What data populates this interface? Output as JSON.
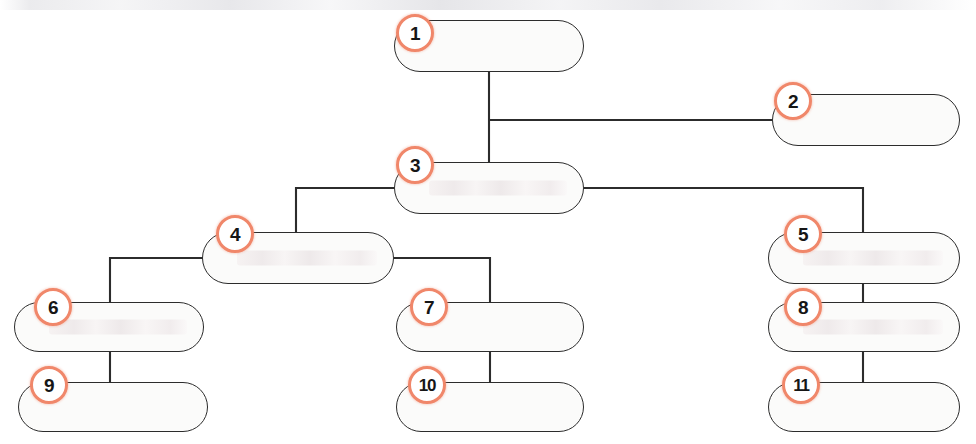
{
  "diagram": {
    "type": "tree",
    "canvas": {
      "width": 976,
      "height": 444
    },
    "style": {
      "badge_ring_color": "#f0876a",
      "badge_fill_color": "#ffffff",
      "badge_text_color": "#161616",
      "node_fill_color": "#fbfbfa",
      "node_border_color": "#2c2c2c",
      "connector_color": "#2c2c2c",
      "background_color": "#ffffff"
    },
    "nodes": [
      {
        "id": "node-1",
        "number": "1",
        "label": "",
        "x": 394,
        "y": 20,
        "w": 190,
        "h": 52,
        "badge_x": 396,
        "badge_y": 14,
        "ghost": false
      },
      {
        "id": "node-2",
        "number": "2",
        "label": "",
        "x": 772,
        "y": 94,
        "w": 188,
        "h": 52,
        "badge_x": 774,
        "badge_y": 82,
        "ghost": false
      },
      {
        "id": "node-3",
        "number": "3",
        "label": "",
        "x": 394,
        "y": 162,
        "w": 190,
        "h": 52,
        "badge_x": 396,
        "badge_y": 146,
        "ghost": true
      },
      {
        "id": "node-4",
        "number": "4",
        "label": "",
        "x": 202,
        "y": 232,
        "w": 192,
        "h": 52,
        "badge_x": 216,
        "badge_y": 215,
        "ghost": true
      },
      {
        "id": "node-5",
        "number": "5",
        "label": "",
        "x": 768,
        "y": 232,
        "w": 192,
        "h": 52,
        "badge_x": 784,
        "badge_y": 215,
        "ghost": true
      },
      {
        "id": "node-6",
        "number": "6",
        "label": "",
        "x": 14,
        "y": 302,
        "w": 190,
        "h": 50,
        "badge_x": 34,
        "badge_y": 288,
        "ghost": true
      },
      {
        "id": "node-7",
        "number": "7",
        "label": "",
        "x": 396,
        "y": 302,
        "w": 188,
        "h": 50,
        "badge_x": 410,
        "badge_y": 288,
        "ghost": false
      },
      {
        "id": "node-8",
        "number": "8",
        "label": "",
        "x": 768,
        "y": 302,
        "w": 192,
        "h": 50,
        "badge_x": 784,
        "badge_y": 288,
        "ghost": true
      },
      {
        "id": "node-9",
        "number": "9",
        "label": "",
        "x": 18,
        "y": 382,
        "w": 190,
        "h": 50,
        "badge_x": 30,
        "badge_y": 366,
        "ghost": false
      },
      {
        "id": "node-10",
        "number": "10",
        "label": "",
        "x": 396,
        "y": 382,
        "w": 188,
        "h": 50,
        "badge_x": 408,
        "badge_y": 366,
        "ghost": false
      },
      {
        "id": "node-11",
        "number": "11",
        "label": "",
        "x": 768,
        "y": 382,
        "w": 192,
        "h": 50,
        "badge_x": 782,
        "badge_y": 366,
        "ghost": false
      }
    ],
    "connectors": [
      {
        "from": "node-1",
        "to": "node-3",
        "path": "M 489 72 L 489 162"
      },
      {
        "from": "node-1",
        "to": "node-2",
        "path": "M 489 120 L 772 120"
      },
      {
        "from": "node-3",
        "to": "node-4",
        "path": "M 394 188 L 296 188 L 296 258 L 202 258"
      },
      {
        "from": "node-3",
        "to": "node-5",
        "path": "M 584 188 L 863 188 L 863 232"
      },
      {
        "from": "node-4",
        "to": "node-6",
        "path": "M 298 258 L 110 258 L 110 327 L 204 327"
      },
      {
        "from": "node-4",
        "to": "node-7",
        "path": "M 394 258 L 490 258 L 490 302"
      },
      {
        "from": "node-6",
        "to": "node-9",
        "path": "M 110 352 L 110 407 L 208 407"
      },
      {
        "from": "node-7",
        "to": "node-10",
        "path": "M 490 352 L 490 382"
      },
      {
        "from": "node-5",
        "to": "node-8",
        "path": "M 863 284 L 863 302"
      },
      {
        "from": "node-8",
        "to": "node-11",
        "path": "M 863 352 L 863 382"
      }
    ]
  }
}
